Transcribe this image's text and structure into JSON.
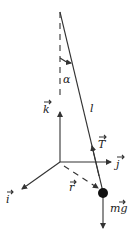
{
  "diagram": {
    "title": "",
    "labels": {
      "alpha": "α",
      "length": "l",
      "k": "k",
      "j": "j",
      "i": "i",
      "r": "r",
      "T": "T",
      "mg": "mg"
    },
    "elements": [
      {
        "id": "pivot-axis",
        "type": "dashed-line",
        "desc": "vertical reference through pivot"
      },
      {
        "id": "rod",
        "type": "line",
        "label": "l"
      },
      {
        "id": "angle",
        "type": "arc",
        "label": "α"
      },
      {
        "id": "k-axis",
        "type": "arrow",
        "label": "k"
      },
      {
        "id": "j-axis",
        "type": "arrow",
        "label": "j"
      },
      {
        "id": "i-axis",
        "type": "arrow",
        "label": "i"
      },
      {
        "id": "position-vector",
        "type": "dashed-arrow",
        "label": "r"
      },
      {
        "id": "tension",
        "type": "arrow",
        "label": "T"
      },
      {
        "id": "weight",
        "type": "arrow",
        "label": "mg"
      },
      {
        "id": "bob",
        "type": "mass"
      }
    ],
    "colors": {
      "ink": "#333333",
      "background": "#ffffff"
    }
  }
}
